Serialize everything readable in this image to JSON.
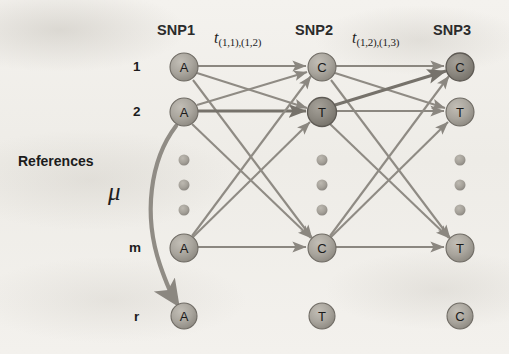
{
  "figure": {
    "title_note": "Hidden Markov model lattice over three SNP columns with reference haplotypes",
    "background_color": "#f1efeb",
    "node_fill": "#a9a59e",
    "node_fill_dark": "#8e8a83",
    "node_stroke": "#6f6b64",
    "edge_color": "#8d8981",
    "text_color": "#1d1d1d"
  },
  "columns": [
    {
      "id": "snp1",
      "label": "SNP1",
      "x": 184,
      "header_x": 157,
      "header_y": 22
    },
    {
      "id": "snp2",
      "label": "SNP2",
      "x": 322,
      "header_x": 295,
      "header_y": 22
    },
    {
      "id": "snp3",
      "label": "SNP3",
      "x": 460,
      "header_x": 433,
      "header_y": 22
    }
  ],
  "rows": [
    {
      "id": "r1",
      "label": "1",
      "y": 67,
      "label_x": 133,
      "label_y": 60,
      "type": "node"
    },
    {
      "id": "r2",
      "label": "2",
      "y": 112,
      "label_x": 133,
      "label_y": 105,
      "type": "node"
    },
    {
      "id": "dots",
      "label": "",
      "y": 185,
      "type": "ellipsis"
    },
    {
      "id": "rm",
      "label": "m",
      "y": 248,
      "label_x": 130,
      "label_y": 241,
      "type": "node"
    },
    {
      "id": "rr",
      "label": "r",
      "y": 316,
      "label_x": 134,
      "label_y": 309,
      "type": "node"
    }
  ],
  "alleles": {
    "r1": [
      "A",
      "C",
      "C"
    ],
    "r2": [
      "A",
      "T",
      "T"
    ],
    "rm": [
      "A",
      "C",
      "T"
    ],
    "rr": [
      "A",
      "T",
      "C"
    ]
  },
  "highlighted_nodes": [
    "r1-snp3",
    "r2-snp2"
  ],
  "ellipsis": {
    "count": 3,
    "dot_radius": 5.5,
    "ys": [
      160,
      185,
      210
    ]
  },
  "labels": {
    "references": {
      "text": "References",
      "x": 18,
      "y": 160
    },
    "mu": {
      "text": "μ",
      "x": 110,
      "y": 193
    }
  },
  "edge_labels": [
    {
      "id": "t12",
      "base": "t",
      "subscript": "(1,1),(1,2)",
      "x": 214,
      "y": 32
    },
    {
      "id": "t23",
      "base": "t",
      "subscript": "(1,2),(1,3)",
      "x": 352,
      "y": 32
    }
  ],
  "edges": {
    "description": "Fully connected bipartite links SNP1→SNP2 and SNP2→SNP3 across rows 1, 2 and m",
    "source_rows": [
      "r1",
      "r2",
      "rm"
    ],
    "target_rows": [
      "r1",
      "r2",
      "rm"
    ],
    "directed": true,
    "mu_arrow": {
      "from_row": "r2",
      "from_col": "snp1",
      "to_row": "rr",
      "to_col": "snp1",
      "curved": true
    }
  },
  "node_radius": 14,
  "node_radius_small": 13
}
